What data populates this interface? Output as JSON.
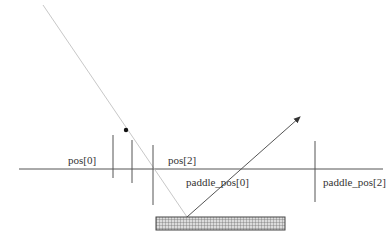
{
  "labels": {
    "pos0": "pos[0]",
    "pos2": "pos[2]",
    "paddle_pos0": "paddle_pos[0]",
    "paddle_pos2": "paddle_pos[2]"
  },
  "colors": {
    "axis": "#555555",
    "incoming_path": "#c8c8c8",
    "outgoing_path": "#555555",
    "ball": "#111111",
    "paddle_fill": "#d0d0d0",
    "paddle_grid": "#666666"
  }
}
